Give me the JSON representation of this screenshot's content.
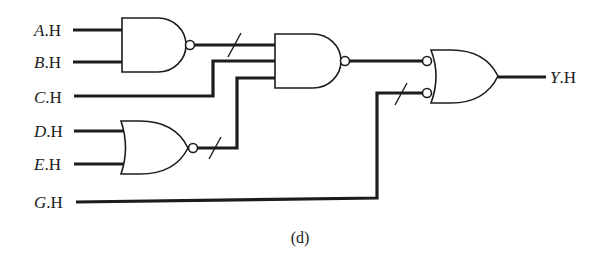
{
  "diagram": {
    "type": "logic-circuit",
    "caption": "(d)",
    "inputs": [
      {
        "id": "A",
        "letter": "A",
        "suffix": ".H"
      },
      {
        "id": "B",
        "letter": "B",
        "suffix": ".H"
      },
      {
        "id": "C",
        "letter": "C",
        "suffix": ".H"
      },
      {
        "id": "D",
        "letter": "D",
        "suffix": ".H"
      },
      {
        "id": "E",
        "letter": "E",
        "suffix": ".H"
      },
      {
        "id": "G",
        "letter": "G",
        "suffix": ".H"
      }
    ],
    "output": {
      "id": "Y",
      "letter": "Y",
      "suffix": ".H"
    },
    "gates": [
      {
        "id": "g1",
        "type": "NAND",
        "inputs": [
          "A",
          "B"
        ]
      },
      {
        "id": "g2",
        "type": "NOR",
        "inputs": [
          "D",
          "E"
        ]
      },
      {
        "id": "g3",
        "type": "NAND",
        "inputs": [
          "g1",
          "C",
          "g2"
        ]
      },
      {
        "id": "g4",
        "type": "OR-with-inverted-inputs",
        "inputs": [
          "g3",
          "G"
        ],
        "output": "Y"
      }
    ],
    "mismatch_marks": [
      "g1-output",
      "g2-output",
      "G-input-to-g4"
    ],
    "colors": {
      "ink": "#1c1c1c",
      "background": "#ffffff"
    }
  }
}
